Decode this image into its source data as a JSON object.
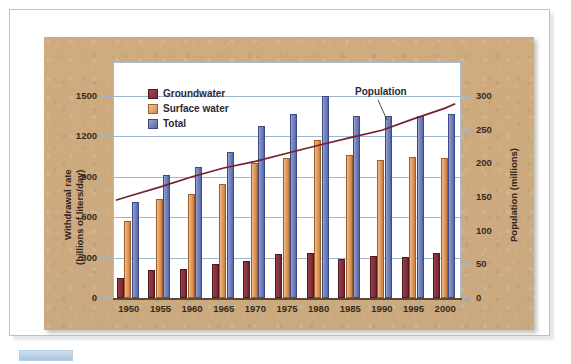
{
  "figure": {
    "panel_bg": "#cfab7f",
    "plot_bg": "#ffffff"
  },
  "legend": {
    "items": [
      {
        "label": "Groundwater",
        "color": "#8a2f3a",
        "key": "groundwater"
      },
      {
        "label": "Surface water",
        "color": "#de9655",
        "key": "surface_water"
      },
      {
        "label": "Total",
        "color": "#6f7ebb",
        "key": "total"
      }
    ]
  },
  "annotations": {
    "population_label": "Population"
  },
  "chart_data": {
    "type": "bar",
    "title": "",
    "xlabel": "",
    "ylabel": "Withdrawal rate (billions of liters/day)",
    "ylabel_line1": "Withdrawal rate",
    "ylabel_line2": "(billions of liters/day)",
    "y2label": "Population (millions)",
    "categories": [
      "1950",
      "1955",
      "1960",
      "1965",
      "1970",
      "1975",
      "1980",
      "1985",
      "1990",
      "1995",
      "2000"
    ],
    "ylim": [
      0,
      1500
    ],
    "yticks": [
      0,
      300,
      600,
      900,
      1200,
      1500
    ],
    "ytick_labels": [
      "0",
      "300",
      "600",
      "900",
      "1200",
      "1500"
    ],
    "y2lim": [
      0,
      300
    ],
    "y2ticks": [
      0,
      50,
      100,
      150,
      200,
      250,
      300
    ],
    "y2tick_labels": [
      "0",
      "50",
      "100",
      "150",
      "200",
      "250",
      "300"
    ],
    "grid": true,
    "legend_position": "upper left",
    "series": [
      {
        "name": "Groundwater",
        "axis": "left",
        "color": "#8a2f3a",
        "values": [
          150,
          205,
          215,
          255,
          275,
          330,
          335,
          290,
          310,
          305,
          335
        ]
      },
      {
        "name": "Surface water",
        "axis": "left",
        "color": "#de9655",
        "values": [
          575,
          735,
          770,
          850,
          1005,
          1040,
          1170,
          1060,
          1025,
          1050,
          1040
        ]
      },
      {
        "name": "Total",
        "axis": "left",
        "color": "#6f7ebb",
        "values": [
          715,
          915,
          975,
          1085,
          1280,
          1365,
          1500,
          1355,
          1350,
          1350,
          1370
        ]
      },
      {
        "name": "Population",
        "axis": "right",
        "type": "line",
        "color": "#7a1f2b",
        "values": [
          151,
          165,
          180,
          193,
          203,
          215,
          227,
          238,
          249,
          266,
          282
        ]
      }
    ]
  }
}
